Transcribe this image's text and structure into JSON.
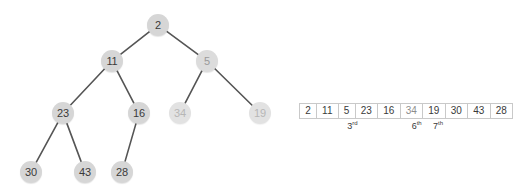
{
  "colors": {
    "node_fill": "#d6d6d6",
    "node_fill_dim": "#e2e2e2",
    "node_text": "#3a3a3a",
    "node_text_dim": "#b6b6b6",
    "edge": "#555555",
    "cell_border": "#c9c9c9",
    "background": "#ffffff"
  },
  "tree": {
    "nodes": [
      {
        "id": "n2",
        "label": "2",
        "x": 158,
        "y": 25,
        "state": "normal"
      },
      {
        "id": "n11",
        "label": "11",
        "x": 112,
        "y": 61,
        "state": "normal"
      },
      {
        "id": "n5",
        "label": "5",
        "x": 207,
        "y": 61,
        "state": "semi"
      },
      {
        "id": "n23",
        "label": "23",
        "x": 63,
        "y": 113,
        "state": "normal"
      },
      {
        "id": "n16",
        "label": "16",
        "x": 139,
        "y": 113,
        "state": "normal"
      },
      {
        "id": "n34",
        "label": "34",
        "x": 180,
        "y": 113,
        "state": "dim"
      },
      {
        "id": "n19",
        "label": "19",
        "x": 260,
        "y": 113,
        "state": "dim"
      },
      {
        "id": "n30",
        "label": "30",
        "x": 31,
        "y": 172,
        "state": "normal"
      },
      {
        "id": "n43",
        "label": "43",
        "x": 85,
        "y": 172,
        "state": "normal"
      },
      {
        "id": "n28",
        "label": "28",
        "x": 122,
        "y": 172,
        "state": "normal"
      }
    ],
    "edges": [
      {
        "from": "n2",
        "to": "n11"
      },
      {
        "from": "n2",
        "to": "n5"
      },
      {
        "from": "n11",
        "to": "n23"
      },
      {
        "from": "n11",
        "to": "n16"
      },
      {
        "from": "n5",
        "to": "n34"
      },
      {
        "from": "n5",
        "to": "n19"
      },
      {
        "from": "n23",
        "to": "n30"
      },
      {
        "from": "n23",
        "to": "n43"
      },
      {
        "from": "n16",
        "to": "n28"
      }
    ]
  },
  "array": {
    "cells": [
      {
        "value": "2",
        "state": "normal"
      },
      {
        "value": "11",
        "state": "normal"
      },
      {
        "value": "5",
        "state": "normal"
      },
      {
        "value": "23",
        "state": "normal"
      },
      {
        "value": "16",
        "state": "normal"
      },
      {
        "value": "34",
        "state": "dim"
      },
      {
        "value": "19",
        "state": "normal"
      },
      {
        "value": "30",
        "state": "normal"
      },
      {
        "value": "43",
        "state": "normal"
      },
      {
        "value": "28",
        "state": "normal"
      }
    ],
    "labels": [
      {
        "text": "3",
        "suffix": "rd",
        "index": 2
      },
      {
        "text": "6",
        "suffix": "th",
        "index": 5
      },
      {
        "text": "7",
        "suffix": "th",
        "index": 6
      }
    ]
  }
}
